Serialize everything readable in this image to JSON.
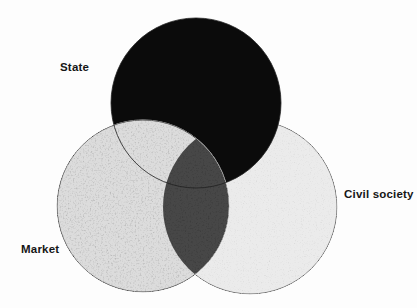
{
  "diagram": {
    "type": "venn",
    "background_color": "#fdfdfd",
    "label_color": "#161616",
    "outline_color": "#5a5a5a",
    "sets": [
      {
        "id": "state",
        "label": "State",
        "fill": "#0b0b0b"
      },
      {
        "id": "market",
        "label": "Market",
        "fill": "#dcdcdc"
      },
      {
        "id": "civil_society",
        "label": "Civil society",
        "fill": "#ebebeb"
      }
    ],
    "overlaps": [
      {
        "between": [
          "market",
          "civil_society"
        ],
        "fill": "#474747"
      },
      {
        "between": [
          "state",
          "market"
        ],
        "fill": "#dcdcdc"
      },
      {
        "between": [
          "state",
          "civil_society"
        ],
        "fill": "#0b0b0b"
      },
      {
        "between": [
          "state",
          "market",
          "civil_society"
        ],
        "fill": "#474747"
      }
    ]
  }
}
